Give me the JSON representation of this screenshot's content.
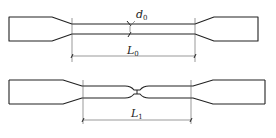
{
  "diagram": {
    "specimens": [
      {
        "id": "original",
        "labels": {
          "diameter": {
            "symbol": "d",
            "subscript": "0"
          },
          "gauge_length": {
            "symbol": "L",
            "subscript": "0"
          }
        }
      },
      {
        "id": "fractured",
        "labels": {
          "gauge_length": {
            "symbol": "L",
            "subscript": "1"
          }
        }
      }
    ],
    "colors": {
      "line": "#222222",
      "dimension": "#555555",
      "background": "#ffffff"
    }
  }
}
